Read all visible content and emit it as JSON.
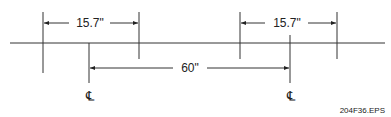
{
  "diagram": {
    "left_spacing_label": "15.7\"",
    "right_spacing_label": "15.7\"",
    "center_spacing_label": "60\"",
    "left_centerline_symbol": "℄",
    "right_centerline_symbol": "℄",
    "figure_id": "204F36.EPS",
    "line_color": "#222222"
  }
}
